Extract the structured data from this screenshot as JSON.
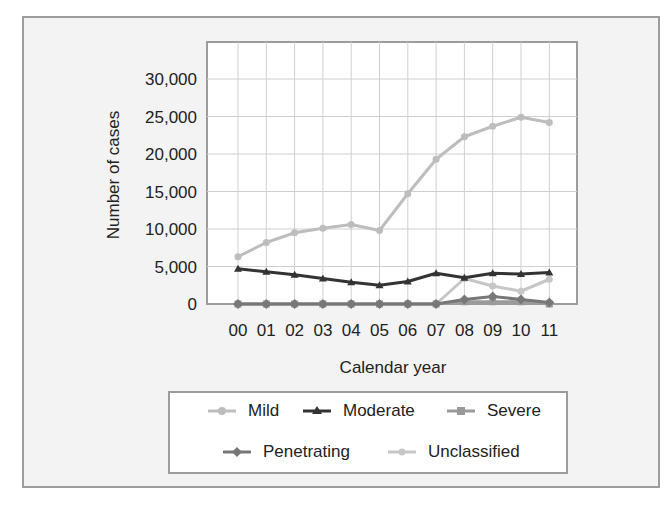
{
  "chart_data": {
    "type": "line",
    "title": "",
    "xlabel": "Calendar year",
    "ylabel": "Number of cases",
    "categories": [
      "00",
      "01",
      "02",
      "03",
      "04",
      "05",
      "06",
      "07",
      "08",
      "09",
      "10",
      "11"
    ],
    "ylim": [
      0,
      32500
    ],
    "yticks": [
      0,
      5000,
      10000,
      15000,
      20000,
      25000,
      30000
    ],
    "ytick_labels": [
      "0",
      "5,000",
      "10,000",
      "15,000",
      "20,000",
      "25,000",
      "30,000"
    ],
    "grid": true,
    "legend_position": "bottom",
    "series": [
      {
        "name": "Mild",
        "color": "#bdbdbd",
        "marker": "circle",
        "values": [
          6300,
          8200,
          9500,
          10100,
          10600,
          9800,
          14700,
          19300,
          22300,
          23700,
          24900,
          24200
        ]
      },
      {
        "name": "Moderate",
        "color": "#333333",
        "marker": "triangle",
        "values": [
          4700,
          4300,
          3900,
          3400,
          2900,
          2500,
          3000,
          4100,
          3500,
          4100,
          4000,
          4200
        ]
      },
      {
        "name": "Severe",
        "color": "#9a9a9a",
        "marker": "square",
        "values": [
          0,
          0,
          0,
          0,
          0,
          0,
          0,
          0,
          300,
          300,
          300,
          0
        ]
      },
      {
        "name": "Penetrating",
        "color": "#777777",
        "marker": "diamond",
        "values": [
          0,
          0,
          0,
          0,
          0,
          0,
          0,
          0,
          600,
          1000,
          600,
          200
        ]
      },
      {
        "name": "Unclassified",
        "color": "#c6c6c6",
        "marker": "star",
        "values": [
          0,
          0,
          0,
          0,
          0,
          0,
          0,
          0,
          3400,
          2400,
          1700,
          3300
        ]
      }
    ]
  },
  "legend": {
    "items": [
      "Mild",
      "Moderate",
      "Severe",
      "Penetrating",
      "Unclassified"
    ]
  }
}
